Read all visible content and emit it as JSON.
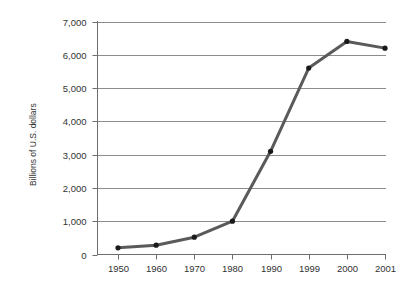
{
  "chart_data": {
    "type": "line",
    "title": "",
    "subtitle": "",
    "xlabel": "",
    "ylabel": "Billions of U.S. dollars",
    "categories": [
      "1950",
      "1960",
      "1970",
      "1980",
      "1990",
      "1999",
      "2000",
      "2001"
    ],
    "values": [
      200,
      280,
      520,
      1000,
      3100,
      5600,
      6400,
      6200
    ],
    "series": [
      {
        "name": "",
        "values": [
          200,
          280,
          520,
          1000,
          3100,
          5600,
          6400,
          6200
        ]
      }
    ],
    "ylim": [
      0,
      7000
    ],
    "yticks": [
      0,
      1000,
      2000,
      3000,
      4000,
      5000,
      6000,
      7000
    ],
    "ytick_labels": [
      "0",
      "1,000",
      "2,000",
      "3,000",
      "4,000",
      "5,000",
      "6,000",
      "7,000"
    ],
    "xtick_labels": [
      "1950",
      "1960",
      "1970",
      "1980",
      "1990",
      "1999",
      "2000",
      "2001"
    ],
    "grid": true,
    "grid_axis": "y",
    "legend": false,
    "legend_position": "none",
    "marker": "circle",
    "annotations": []
  },
  "style": {
    "line_color": "#5a5a5a",
    "marker_color": "#1a1a1a",
    "grid_color": "#8c8c8c",
    "axis_color": "#6e6e6e",
    "text_color": "#333333",
    "background": "#ffffff"
  }
}
